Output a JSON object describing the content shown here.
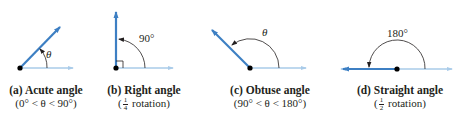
{
  "colors": {
    "terminal_ray": "#3d7fc3",
    "initial_ray": "#a9cbe9",
    "arc": "#231f20",
    "vertex": "#000000"
  },
  "panels": [
    {
      "id": "a",
      "caption": "(a)  Acute angle",
      "subcaption": "(0° < θ < 90°)",
      "angle_label": "θ"
    },
    {
      "id": "b",
      "caption": "(b)  Right angle",
      "sub_open": "(",
      "frac_num": "1",
      "frac_den": "4",
      "sub_close": " rotation)",
      "angle_label": "90°"
    },
    {
      "id": "c",
      "caption": "(c)  Obtuse angle",
      "subcaption": "(90° < θ < 180°)",
      "angle_label": "θ"
    },
    {
      "id": "d",
      "caption": "(d)  Straight angle",
      "sub_open": "(",
      "frac_num": "1",
      "frac_den": "2",
      "sub_close": " rotation)",
      "angle_label": "180°"
    }
  ]
}
